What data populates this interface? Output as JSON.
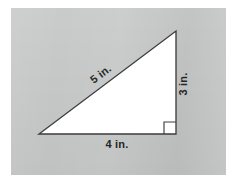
{
  "figure": {
    "name": "right-triangle-diagram",
    "shape": "right triangle",
    "background_color": "#c6c7c7",
    "page_color": "#ffffff",
    "fill_color": "#ffffff",
    "stroke_color": "#3d3d3d",
    "units": "in.",
    "panel": {
      "x": 11,
      "y": 8,
      "width": 215,
      "height": 167
    },
    "vertices": {
      "bottom_left": {
        "x": 39,
        "y": 134
      },
      "bottom_right": {
        "x": 176,
        "y": 134
      },
      "apex": {
        "x": 176,
        "y": 31
      }
    },
    "right_angle": {
      "at": "bottom-right",
      "marker_size": 12,
      "marker_x": 164,
      "marker_y": 122
    },
    "labels": {
      "hypotenuse": {
        "text": "5 in.",
        "value": 5,
        "rotation": -37,
        "x": 103,
        "y": 77
      },
      "vertical_leg": {
        "text": "3 in.",
        "value": 3,
        "rotation": -90,
        "x": 187,
        "y": 84
      },
      "horizontal_leg": {
        "text": "4 in.",
        "value": 4,
        "rotation": 0,
        "x": 117,
        "y": 148
      }
    }
  }
}
